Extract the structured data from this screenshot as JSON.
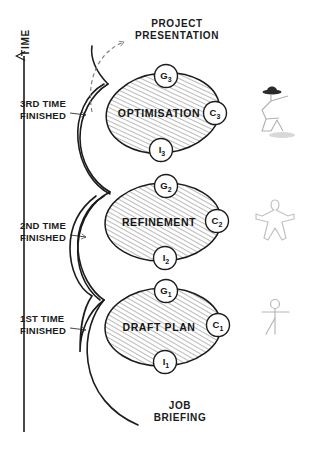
{
  "diagram": {
    "title_top": "PROJECT\nPRESENTATION",
    "title_bottom": "JOB\nBRIEFING",
    "axis_label": "TIME",
    "colors": {
      "ink": "#1b1b1b",
      "hatch": "#9a9a9a",
      "figure": "#b5b5b5",
      "shadow": "#cfcfcf",
      "background": "#ffffff"
    },
    "milestones": [
      {
        "id": "m3",
        "text": "3RD TIME\nFINISHED"
      },
      {
        "id": "m2",
        "text": "2ND TIME\nFINISHED"
      },
      {
        "id": "m1",
        "text": "1ST TIME\nFINISHED"
      }
    ],
    "cycles": [
      {
        "id": "cycle3",
        "stage": "OPTIMISATION",
        "nodes": [
          {
            "id": "g3",
            "letter": "G",
            "index": "3",
            "position": "top"
          },
          {
            "id": "c3",
            "letter": "C",
            "index": "3",
            "position": "right"
          },
          {
            "id": "i3",
            "letter": "I",
            "index": "3",
            "position": "bottom"
          }
        ],
        "figure": "hat-figure-icon"
      },
      {
        "id": "cycle2",
        "stage": "REFINEMENT",
        "nodes": [
          {
            "id": "g2",
            "letter": "G",
            "index": "2",
            "position": "top"
          },
          {
            "id": "c2",
            "letter": "C",
            "index": "2",
            "position": "right"
          },
          {
            "id": "i2",
            "letter": "I",
            "index": "2",
            "position": "bottom"
          }
        ],
        "figure": "star-figure-icon"
      },
      {
        "id": "cycle1",
        "stage": "DRAFT PLAN",
        "nodes": [
          {
            "id": "g1",
            "letter": "G",
            "index": "1",
            "position": "top"
          },
          {
            "id": "c1",
            "letter": "C",
            "index": "1",
            "position": "right"
          },
          {
            "id": "i1",
            "letter": "I",
            "index": "1",
            "position": "bottom"
          }
        ],
        "figure": "stick-figure-icon"
      }
    ]
  }
}
